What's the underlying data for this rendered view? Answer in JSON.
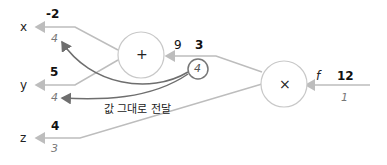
{
  "diagram": {
    "inputs": [
      {
        "name": "x",
        "forward": "-2",
        "backward": "4"
      },
      {
        "name": "y",
        "forward": "5",
        "backward": "4"
      },
      {
        "name": "z",
        "forward": "4",
        "backward": "3"
      }
    ],
    "nodes": {
      "add": {
        "op": "+",
        "out_forward": "3",
        "out_backward_label": "9"
      },
      "mul": {
        "op": "×",
        "out_name": "f",
        "out_forward": "12",
        "out_backward": "1"
      },
      "gradient_badge": "4"
    },
    "note": "값 그대로 전달",
    "colors": {
      "edge": "#bdbdbd",
      "grad_arrow": "#6e6e6e",
      "node_border": "#c8c8c8",
      "badge_border": "#777777"
    }
  }
}
